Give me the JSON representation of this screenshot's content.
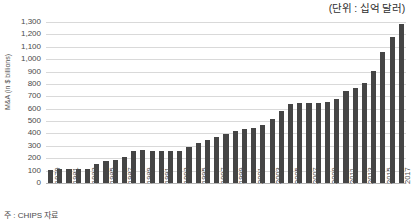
{
  "unit_note": "(단위 : 십억 달러)",
  "source_note": "주 : CHIPS 자료",
  "colors": {
    "bar": "#454545",
    "gridline": "#d9d9d9",
    "baseline": "#b4b4b4",
    "text": "#4a4a4a"
  },
  "chart_data": {
    "type": "bar",
    "title": "",
    "subtitle": "",
    "xlabel": "",
    "ylabel": "M&A (in $ billions)",
    "ylim": [
      0,
      1300
    ],
    "ytick_step": 100,
    "grid": true,
    "legend": false,
    "annotations": [
      "(단위 : 십억 달러)"
    ],
    "ytick_labels": [
      "0",
      "100",
      "200",
      "300",
      "400",
      "500",
      "600",
      "700",
      "800",
      "900",
      "1,000",
      "1,100",
      "1,200",
      "1,300"
    ],
    "ytick_values": [
      0,
      100,
      200,
      300,
      400,
      500,
      600,
      700,
      800,
      900,
      1000,
      1100,
      1200,
      1300
    ],
    "xtick_labels": [
      "1979",
      "1981",
      "1983",
      "1985",
      "1987",
      "1989",
      "1991",
      "1993",
      "1995",
      "1997",
      "1999",
      "2001",
      "2003",
      "2005",
      "2007",
      "2009",
      "2011",
      "2013",
      "2015",
      "2017"
    ],
    "categories": [
      "1979",
      "1980",
      "1981",
      "1982",
      "1983",
      "1984",
      "1985",
      "1986",
      "1987",
      "1988",
      "1989",
      "1990",
      "1991",
      "1992",
      "1993",
      "1994",
      "1995",
      "1996",
      "1997",
      "1998",
      "1999",
      "2000",
      "2001",
      "2002",
      "2003",
      "2004",
      "2005",
      "2006",
      "2007",
      "2008",
      "2009",
      "2010",
      "2011",
      "2012",
      "2013",
      "2014",
      "2015",
      "2016",
      "2017"
    ],
    "values": [
      105,
      110,
      112,
      110,
      115,
      150,
      178,
      185,
      212,
      255,
      268,
      262,
      258,
      258,
      262,
      290,
      322,
      350,
      372,
      398,
      420,
      440,
      448,
      470,
      520,
      585,
      640,
      648,
      648,
      648,
      655,
      682,
      740,
      768,
      810,
      905,
      1060,
      1180,
      1288
    ]
  }
}
